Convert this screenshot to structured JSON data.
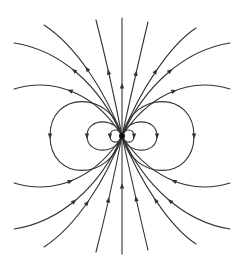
{
  "diagram": {
    "type": "dipole-field-lines",
    "title": "",
    "colors": {
      "line": "#333333",
      "background": "#ffffff",
      "core": "#111111"
    },
    "center": [
      122,
      136
    ],
    "axis": {
      "x": 122,
      "y_top": 18,
      "y_bottom": 254
    },
    "top_lines": [
      {
        "end": [
          14,
          43
        ],
        "ctrl1": [
          60,
          50
        ],
        "ctrl2": [
          100,
          85
        ]
      },
      {
        "end": [
          14,
          89
        ],
        "ctrl1": [
          60,
          75
        ],
        "ctrl2": [
          100,
          100
        ]
      },
      {
        "end": [
          44,
          25
        ],
        "ctrl1": [
          75,
          45
        ],
        "ctrl2": [
          105,
          90
        ]
      },
      {
        "end": [
          96,
          20
        ],
        "ctrl1": [
          105,
          55
        ],
        "ctrl2": [
          115,
          100
        ]
      },
      {
        "end": [
          148,
          22
        ],
        "ctrl1": [
          140,
          55
        ],
        "ctrl2": [
          130,
          100
        ]
      },
      {
        "end": [
          196,
          28
        ],
        "ctrl1": [
          170,
          45
        ],
        "ctrl2": [
          140,
          90
        ]
      },
      {
        "end": [
          230,
          43
        ],
        "ctrl1": [
          185,
          50
        ],
        "ctrl2": [
          145,
          85
        ]
      },
      {
        "end": [
          230,
          89
        ],
        "ctrl1": [
          185,
          75
        ],
        "ctrl2": [
          145,
          100
        ]
      }
    ],
    "loops": [
      {
        "side": "left",
        "rx": 72,
        "ry": 34
      },
      {
        "side": "left",
        "rx": 35,
        "ry": 14
      },
      {
        "side": "left",
        "rx": 12,
        "ry": 6
      },
      {
        "side": "right",
        "rx": 72,
        "ry": 34
      },
      {
        "side": "right",
        "rx": 35,
        "ry": 14
      },
      {
        "side": "right",
        "rx": 12,
        "ry": 6
      }
    ],
    "arrow_direction": {
      "top": "outward",
      "bottom": "inward",
      "loops": "downward-at-outer-edge"
    }
  }
}
